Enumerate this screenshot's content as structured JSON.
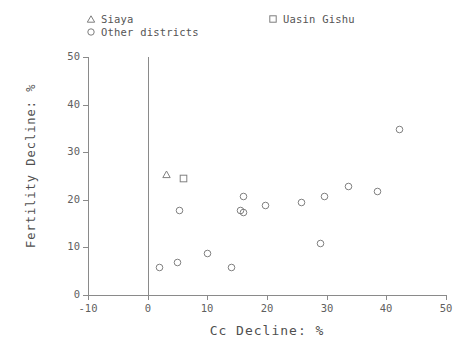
{
  "chart_data": {
    "type": "scatter",
    "title": "",
    "xlabel": "Cc Decline: %",
    "ylabel": "Fertility Decline: %",
    "xlim": [
      -10,
      50
    ],
    "ylim": [
      0,
      50
    ],
    "xticks": [
      -10,
      0,
      10,
      20,
      30,
      40,
      50
    ],
    "yticks": [
      0,
      10,
      20,
      30,
      40,
      50
    ],
    "xticklabels": [
      "-10",
      "0",
      "10",
      "20",
      "30",
      "40",
      "50"
    ],
    "yticklabels": [
      "0",
      "10",
      "20",
      "30",
      "40",
      "50"
    ],
    "grid": false,
    "legend_position": "above-axes",
    "annotations": [
      {
        "type": "vline",
        "x": 0,
        "label": ""
      }
    ],
    "series": [
      {
        "name": "Siaya",
        "marker": "triangle",
        "points": [
          {
            "x": 3.2,
            "y": 26.6
          }
        ]
      },
      {
        "name": "Uasin Gishu",
        "marker": "square",
        "points": [
          {
            "x": 6.0,
            "y": 25.8
          }
        ]
      },
      {
        "name": "Other districts",
        "marker": "circle",
        "points": [
          {
            "x": 2.0,
            "y": 7.0
          },
          {
            "x": 5.0,
            "y": 8.0
          },
          {
            "x": 5.4,
            "y": 19.0
          },
          {
            "x": 10.0,
            "y": 10.0
          },
          {
            "x": 14.0,
            "y": 7.0
          },
          {
            "x": 15.6,
            "y": 19.0
          },
          {
            "x": 16.0,
            "y": 22.0
          },
          {
            "x": 16.0,
            "y": 18.5
          },
          {
            "x": 19.7,
            "y": 20.0
          },
          {
            "x": 25.8,
            "y": 20.8
          },
          {
            "x": 29.6,
            "y": 22.0
          },
          {
            "x": 29.0,
            "y": 12.0
          },
          {
            "x": 33.6,
            "y": 24.0
          },
          {
            "x": 38.5,
            "y": 23.0
          },
          {
            "x": 42.2,
            "y": 36.0
          }
        ]
      }
    ]
  },
  "legend": {
    "entries": [
      {
        "label": "Siaya",
        "marker": "triangle-icon"
      },
      {
        "label": "Other districts",
        "marker": "circle-icon"
      },
      {
        "label": "Uasin Gishu",
        "marker": "square-icon"
      }
    ]
  }
}
